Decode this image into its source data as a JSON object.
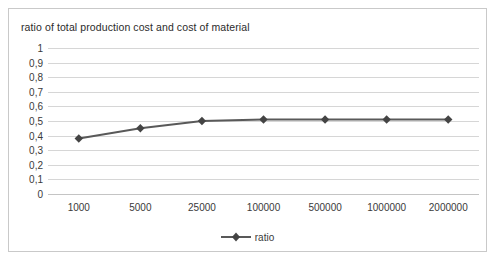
{
  "chart_data": {
    "type": "line",
    "title": "ratio of total production cost and cost of material",
    "xlabel": "",
    "ylabel": "",
    "categories": [
      "1000",
      "5000",
      "25000",
      "100000",
      "500000",
      "1000000",
      "2000000"
    ],
    "series": [
      {
        "name": "ratio",
        "values": [
          0.38,
          0.45,
          0.5,
          0.51,
          0.51,
          0.51,
          0.51
        ]
      }
    ],
    "ylim": [
      0,
      1
    ],
    "ytick_labels": [
      "1",
      "0,9",
      "0,8",
      "0,7",
      "0,6",
      "0,5",
      "0,4",
      "0,3",
      "0,2",
      "0,1",
      "0"
    ],
    "ytick_values": [
      1,
      0.9,
      0.8,
      0.7,
      0.6,
      0.5,
      0.4,
      0.3,
      0.2,
      0.1,
      0
    ],
    "grid": true,
    "legend_position": "bottom",
    "series_color": "#595959",
    "gridline_color": "#d6d6d6",
    "marker": "diamond"
  },
  "legend": {
    "entries": [
      {
        "label": "ratio"
      }
    ]
  }
}
